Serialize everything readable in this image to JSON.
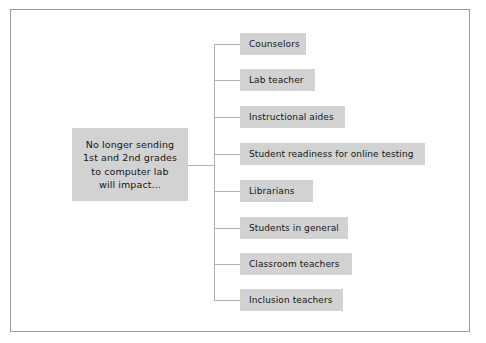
{
  "diagram": {
    "type": "hierarchy-tree",
    "orientation": "left-to-right",
    "colors": {
      "node_fill": "#d2d2d2",
      "connector": "#b0b0b0",
      "frame_border": "#9b9b9b",
      "background": "#ffffff",
      "text": "#161616"
    },
    "root": {
      "label": "No longer sending\n1st and 2nd grades\nto computer lab\nwill impact...",
      "lines": [
        "No longer sending",
        "1st and 2nd grades",
        "to computer lab",
        "will impact..."
      ]
    },
    "branches": [
      {
        "label": "Counselors",
        "width": 66
      },
      {
        "label": "Lab teacher",
        "width": 75
      },
      {
        "label": "Instructional aides",
        "width": 105
      },
      {
        "label": "Student readiness for online testing",
        "width": 185
      },
      {
        "label": "Librarians",
        "width": 73
      },
      {
        "label": "Students in general",
        "width": 108
      },
      {
        "label": "Classroom teachers",
        "width": 112
      },
      {
        "label": "Inclusion teachers",
        "width": 103
      }
    ]
  }
}
